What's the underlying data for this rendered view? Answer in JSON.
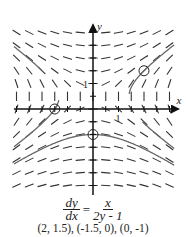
{
  "diagram": {
    "type": "slope_field",
    "equation": {
      "lhs_num": "dy",
      "lhs_den": "dx",
      "eq": "=",
      "rhs_num": "x",
      "rhs_den": "2y - 1"
    },
    "points_caption": "(2, 1.5),  (-1.5, 0),  (0, -1)",
    "axis_labels": {
      "x": "x",
      "y": "y"
    },
    "tick_labels": {
      "x_one": "1",
      "y_one": "1"
    },
    "x_range": [
      -3,
      3.2
    ],
    "y_range": [
      -3.5,
      3
    ],
    "tick_step": 0.5,
    "field_step": 0.5,
    "initial_points": [
      {
        "x": 2,
        "y": 1.5
      },
      {
        "x": -1.5,
        "y": 0
      },
      {
        "x": 0,
        "y": -1
      }
    ],
    "colors": {
      "segments": "#333333",
      "curves": "#666666",
      "axes": "#111111"
    }
  }
}
